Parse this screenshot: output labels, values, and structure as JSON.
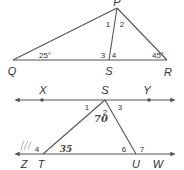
{
  "figure_top": {
    "title": "Triangle PQR with cevian PS",
    "points": [
      {
        "name": "P",
        "x": 117,
        "y": 8,
        "label_x": 117,
        "label_y": 6
      },
      {
        "name": "Q",
        "x": 13,
        "y": 60,
        "label_x": 12,
        "label_y": 75
      },
      {
        "name": "S",
        "x": 109,
        "y": 60,
        "label_x": 109,
        "label_y": 75
      },
      {
        "name": "R",
        "x": 167,
        "y": 60,
        "label_x": 168,
        "label_y": 76
      }
    ],
    "angle_labels": [
      {
        "id": "1",
        "text": "1",
        "x": 108,
        "y": 27
      },
      {
        "id": "2",
        "text": "2",
        "x": 122,
        "y": 27
      },
      {
        "id": "3",
        "text": "3",
        "x": 103,
        "y": 58
      },
      {
        "id": "4",
        "text": "4",
        "x": 114,
        "y": 58
      }
    ],
    "given_angles": [
      {
        "vertex": "Q",
        "text": "25°",
        "x": 45,
        "y": 58
      },
      {
        "vertex": "R",
        "text": "45°",
        "x": 158,
        "y": 58
      }
    ]
  },
  "figure_bottom": {
    "title": "Triangle STU between parallel lines XY and ZW",
    "line_top": {
      "y": 100,
      "x1": 17,
      "x2": 173,
      "label_left": "X",
      "label_right": "Y"
    },
    "line_bottom": {
      "y": 154,
      "x1": 17,
      "x2": 173,
      "label_left": "Z",
      "label_right": "W"
    },
    "points": [
      {
        "name": "X",
        "x": 42,
        "y": 100,
        "label_x": 43,
        "label_y": 94,
        "dot": true
      },
      {
        "name": "S",
        "x": 105,
        "y": 100,
        "label_x": 105,
        "label_y": 94,
        "dot": false
      },
      {
        "name": "Y",
        "x": 149,
        "y": 100,
        "label_x": 147,
        "label_y": 94,
        "dot": true
      },
      {
        "name": "Z",
        "x": 24,
        "y": 154,
        "label_x": 24,
        "label_y": 168,
        "dot": false
      },
      {
        "name": "T",
        "x": 43,
        "y": 154,
        "label_x": 41,
        "label_y": 168,
        "dot": false
      },
      {
        "name": "U",
        "x": 136,
        "y": 154,
        "label_x": 136,
        "label_y": 168,
        "dot": false
      },
      {
        "name": "W",
        "x": 158,
        "y": 154,
        "label_x": 158,
        "label_y": 168,
        "dot": false
      }
    ],
    "angle_labels": [
      {
        "id": "1",
        "text": "1",
        "x": 87,
        "y": 110
      },
      {
        "id": "2",
        "text": "2",
        "x": 105,
        "y": 115
      },
      {
        "id": "3",
        "text": "3",
        "x": 120,
        "y": 110
      },
      {
        "id": "4",
        "text": "4",
        "x": 37,
        "y": 152
      },
      {
        "id": "6",
        "text": "6",
        "x": 124,
        "y": 152
      },
      {
        "id": "7",
        "text": "7",
        "x": 142,
        "y": 152
      }
    ],
    "handwritten_annotations": [
      {
        "text": "70",
        "x": 101,
        "y": 122,
        "near_angle": "2"
      },
      {
        "text": "35",
        "x": 66,
        "y": 152,
        "near_angle": "T"
      },
      {
        "text": ")))",
        "x": 27,
        "y": 148,
        "near_angle": "4"
      }
    ]
  }
}
